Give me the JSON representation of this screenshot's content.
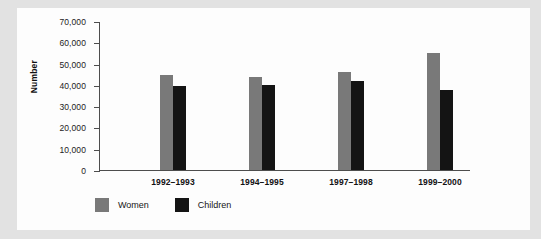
{
  "chart_data": {
    "type": "bar",
    "title": "",
    "xlabel": "",
    "ylabel": "Number",
    "categories": [
      "1992–1993",
      "1994–1995",
      "1997–1998",
      "1999–2000"
    ],
    "series": [
      {
        "name": "Women",
        "color": "#797979",
        "values": [
          44500,
          43500,
          46000,
          55000
        ]
      },
      {
        "name": "Children",
        "color": "#141414",
        "values": [
          39500,
          40000,
          42000,
          37500
        ]
      }
    ],
    "ylim": [
      0,
      70000
    ],
    "ytick_values": [
      70000,
      60000,
      50000,
      40000,
      30000,
      20000,
      10000,
      0
    ],
    "ytick_labels": [
      "70,000",
      "60,000",
      "50,000",
      "40,000",
      "30,000",
      "20,000",
      "10,000",
      "0"
    ],
    "grid": false,
    "legend_position": "bottom-left"
  },
  "legend": {
    "items": [
      {
        "label": "Women",
        "color": "#797979"
      },
      {
        "label": "Children",
        "color": "#141414"
      }
    ]
  },
  "colors": {
    "women": "#797979",
    "children": "#141414",
    "axis": "#4d4d4d",
    "page_border": "#e2e2e2",
    "plate": "#fdfdfd"
  }
}
